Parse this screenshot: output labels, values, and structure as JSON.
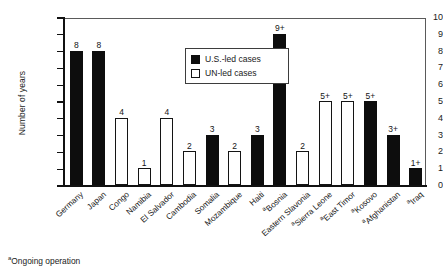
{
  "chart_data": {
    "type": "bar",
    "title": "",
    "xlabel": "",
    "ylabel": "Number of years",
    "ylim": [
      0,
      10
    ],
    "ytick_labels": [
      "0",
      "1",
      "2",
      "3",
      "4",
      "5",
      "6",
      "7",
      "8",
      "9",
      "10"
    ],
    "grid": false,
    "legend_position": "upper-center-left",
    "legend": [
      {
        "key": "us",
        "label": "U.S.-led cases",
        "fill": "#0d0d0d"
      },
      {
        "key": "un",
        "label": "UN-led cases",
        "fill": "#ffffff"
      }
    ],
    "categories": [
      "Germany",
      "Japan",
      "Congo",
      "Namibia",
      "El Salvador",
      "Cambodia",
      "Somalia",
      "Mozambique",
      "Haiti",
      "Bosnia",
      "Eastern Slavonia",
      "Sierra Leone",
      "East Timor",
      "Kosovo",
      "Afghanistan",
      "Iraq"
    ],
    "values": [
      8,
      8,
      4,
      1,
      4,
      2,
      3,
      2,
      3,
      9,
      2,
      5,
      5,
      5,
      3,
      1
    ],
    "data_labels": [
      "8",
      "8",
      "4",
      "1",
      "4",
      "2",
      "3",
      "2",
      "3",
      "9+",
      "2",
      "5+",
      "5+",
      "5+",
      "3+",
      "1+"
    ],
    "series_key": [
      "us",
      "us",
      "un",
      "un",
      "un",
      "un",
      "us",
      "un",
      "us",
      "us",
      "un",
      "un",
      "un",
      "us",
      "us",
      "us"
    ],
    "ongoing_marker": [
      false,
      false,
      false,
      false,
      false,
      false,
      false,
      false,
      false,
      true,
      false,
      true,
      true,
      true,
      true,
      true
    ],
    "footnote_marker": "a",
    "footnote": "Ongoing operation",
    "bars": [
      {
        "category": "Germany",
        "value": 8,
        "label": "8",
        "series": "us",
        "ongoing": false
      },
      {
        "category": "Japan",
        "value": 8,
        "label": "8",
        "series": "us",
        "ongoing": false
      },
      {
        "category": "Congo",
        "value": 4,
        "label": "4",
        "series": "un",
        "ongoing": false
      },
      {
        "category": "Namibia",
        "value": 1,
        "label": "1",
        "series": "un",
        "ongoing": false
      },
      {
        "category": "El Salvador",
        "value": 4,
        "label": "4",
        "series": "un",
        "ongoing": false
      },
      {
        "category": "Cambodia",
        "value": 2,
        "label": "2",
        "series": "un",
        "ongoing": false
      },
      {
        "category": "Somalia",
        "value": 3,
        "label": "3",
        "series": "us",
        "ongoing": false
      },
      {
        "category": "Mozambique",
        "value": 2,
        "label": "2",
        "series": "un",
        "ongoing": false
      },
      {
        "category": "Haiti",
        "value": 3,
        "label": "3",
        "series": "us",
        "ongoing": false
      },
      {
        "category": "Bosnia",
        "value": 9,
        "label": "9+",
        "series": "us",
        "ongoing": true
      },
      {
        "category": "Eastern Slavonia",
        "value": 2,
        "label": "2",
        "series": "un",
        "ongoing": false
      },
      {
        "category": "Sierra Leone",
        "value": 5,
        "label": "5+",
        "series": "un",
        "ongoing": true
      },
      {
        "category": "East Timor",
        "value": 5,
        "label": "5+",
        "series": "un",
        "ongoing": true
      },
      {
        "category": "Kosovo",
        "value": 5,
        "label": "5+",
        "series": "us",
        "ongoing": true
      },
      {
        "category": "Afghanistan",
        "value": 3,
        "label": "3+",
        "series": "us",
        "ongoing": true
      },
      {
        "category": "Iraq",
        "value": 1,
        "label": "1+",
        "series": "us",
        "ongoing": true
      }
    ]
  }
}
